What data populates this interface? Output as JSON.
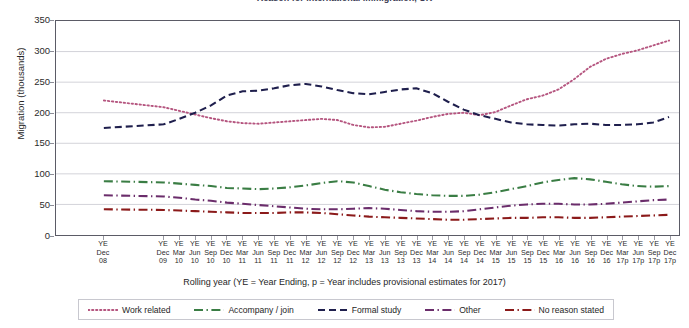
{
  "chart_title": "Reason for international immigration, UK",
  "axes": {
    "y_title": "Migration (thousands)",
    "x_title": "Rolling year (YE = Year Ending, p = Year includes provisional estimates for 2017)",
    "y_ticks": [
      "0",
      "50",
      "100",
      "150",
      "200",
      "250",
      "300",
      "350"
    ],
    "ylim": [
      0,
      350
    ],
    "grid": "horizontal"
  },
  "legend": {
    "position": "bottom",
    "entries": [
      {
        "label": "Work related",
        "color": "#b5557f",
        "dash": "dotted"
      },
      {
        "label": "Accompany / join",
        "color": "#3a7d44",
        "dash": "dash-dot"
      },
      {
        "label": "Formal study",
        "color": "#1f1f4d",
        "dash": "dashed"
      },
      {
        "label": "Other",
        "color": "#6b2d6b",
        "dash": "dash-dot"
      },
      {
        "label": "No reason stated",
        "color": "#8b1a1a",
        "dash": "dash-dot"
      }
    ]
  },
  "chart_data": {
    "type": "line",
    "title": "Reason for international immigration, UK",
    "xlabel": "Rolling year (YE = Year Ending, p = Year includes provisional estimates for 2017)",
    "ylabel": "Migration (thousands)",
    "ylim": [
      0,
      350
    ],
    "yticks": [
      0,
      50,
      100,
      150,
      200,
      250,
      300,
      350
    ],
    "grid": true,
    "legend_position": "bottom",
    "categories": [
      "YE Dec 08",
      "YE Dec 09",
      "YE Mar 10",
      "YE Jun 10",
      "YE Sep 10",
      "YE Dec 10",
      "YE Mar 11",
      "YE Jun 11",
      "YE Sep 11",
      "YE Dec 11",
      "YE Mar 12",
      "YE Jun 12",
      "YE Sep 12",
      "YE Dec 12",
      "YE Mar 13",
      "YE Jun 13",
      "YE Sep 13",
      "YE Dec 13",
      "YE Mar 14",
      "YE Jun 14",
      "YE Sep 14",
      "YE Dec 14",
      "YE Mar 15",
      "YE Jun 15",
      "YE Sep 15",
      "YE Dec 15",
      "YE Mar 16",
      "YE Jun 16",
      "YE Sep 16",
      "YE Dec 16",
      "YE Mar 17p",
      "YE Jun 17p",
      "YE Sep 17p",
      "YE Dec 17p"
    ],
    "category_lines": [
      [
        "YE",
        "Dec",
        "08"
      ],
      [
        "YE",
        "Dec",
        "09"
      ],
      [
        "YE",
        "Mar",
        "10"
      ],
      [
        "YE",
        "Jun",
        "10"
      ],
      [
        "YE",
        "Sep",
        "10"
      ],
      [
        "YE",
        "Dec",
        "10"
      ],
      [
        "YE",
        "Mar",
        "11"
      ],
      [
        "YE",
        "Jun",
        "11"
      ],
      [
        "YE",
        "Sep",
        "11"
      ],
      [
        "YE",
        "Dec",
        "11"
      ],
      [
        "YE",
        "Mar",
        "12"
      ],
      [
        "YE",
        "Jun",
        "12"
      ],
      [
        "YE",
        "Sep",
        "12"
      ],
      [
        "YE",
        "Dec",
        "12"
      ],
      [
        "YE",
        "Mar",
        "13"
      ],
      [
        "YE",
        "Jun",
        "13"
      ],
      [
        "YE",
        "Sep",
        "13"
      ],
      [
        "YE",
        "Dec",
        "13"
      ],
      [
        "YE",
        "Mar",
        "14"
      ],
      [
        "YE",
        "Jun",
        "14"
      ],
      [
        "YE",
        "Sep",
        "14"
      ],
      [
        "YE",
        "Dec",
        "14"
      ],
      [
        "YE",
        "Mar",
        "15"
      ],
      [
        "YE",
        "Jun",
        "15"
      ],
      [
        "YE",
        "Sep",
        "15"
      ],
      [
        "YE",
        "Dec",
        "15"
      ],
      [
        "YE",
        "Mar",
        "16"
      ],
      [
        "YE",
        "Jun",
        "16"
      ],
      [
        "YE",
        "Sep",
        "16"
      ],
      [
        "YE",
        "Dec",
        "16"
      ],
      [
        "YE",
        "Mar",
        "17p"
      ],
      [
        "YE",
        "Jun",
        "17p"
      ],
      [
        "YE",
        "Sep",
        "17p"
      ],
      [
        "YE",
        "Dec",
        "17p"
      ]
    ],
    "category_gap_after_index": 0,
    "series": [
      {
        "name": "Work related",
        "color": "#b5557f",
        "dash": "dotted",
        "values": [
          220,
          209,
          203,
          197,
          191,
          186,
          183,
          182,
          184,
          186,
          188,
          190,
          188,
          180,
          176,
          177,
          182,
          187,
          193,
          198,
          200,
          196,
          201,
          212,
          222,
          228,
          238,
          255,
          275,
          288,
          296,
          302,
          310,
          318
        ]
      },
      {
        "name": "Accompany / join",
        "color": "#3a7d44",
        "dash": "dash-dot",
        "values": [
          88,
          86,
          84,
          82,
          80,
          77,
          76,
          75,
          76,
          78,
          81,
          85,
          88,
          86,
          80,
          74,
          70,
          67,
          65,
          64,
          64,
          66,
          70,
          75,
          80,
          86,
          90,
          93,
          91,
          87,
          83,
          80,
          79,
          80
        ]
      },
      {
        "name": "Formal study",
        "color": "#1f1f4d",
        "dash": "dashed",
        "values": [
          175,
          181,
          190,
          200,
          212,
          228,
          235,
          236,
          240,
          245,
          247,
          243,
          237,
          232,
          230,
          234,
          238,
          240,
          232,
          218,
          205,
          196,
          190,
          184,
          181,
          180,
          179,
          181,
          182,
          180,
          180,
          181,
          184,
          193
        ]
      },
      {
        "name": "Other",
        "color": "#6b2d6b",
        "dash": "dash-dot",
        "values": [
          65,
          63,
          61,
          58,
          56,
          53,
          51,
          49,
          47,
          45,
          43,
          42,
          42,
          43,
          44,
          43,
          41,
          39,
          38,
          38,
          39,
          42,
          45,
          48,
          50,
          51,
          51,
          50,
          50,
          51,
          53,
          55,
          57,
          58
        ]
      },
      {
        "name": "No reason stated",
        "color": "#8b1a1a",
        "dash": "dash-dot",
        "values": [
          42,
          41,
          40,
          39,
          38,
          37,
          36,
          36,
          36,
          37,
          37,
          36,
          34,
          32,
          30,
          29,
          28,
          27,
          26,
          25,
          25,
          26,
          27,
          28,
          28,
          29,
          29,
          28,
          28,
          29,
          30,
          31,
          32,
          33
        ]
      }
    ]
  },
  "later_series_overrides": {
    "note": ""
  }
}
